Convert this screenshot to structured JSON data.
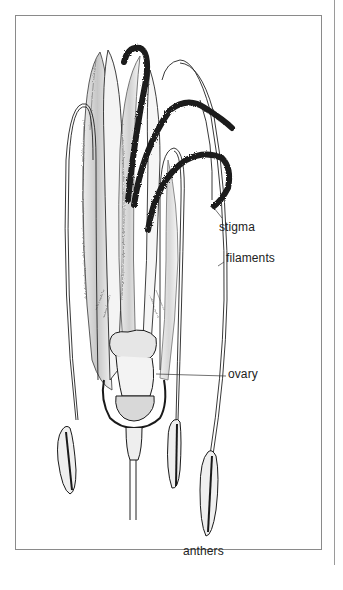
{
  "figure": {
    "labels": {
      "stigma": "stigma",
      "filaments": "filaments",
      "ovary": "ovary",
      "anthers": "anthers"
    }
  },
  "colors": {
    "ink": "#1a1a1a",
    "frame": "#8a8a8a",
    "background": "#ffffff"
  }
}
